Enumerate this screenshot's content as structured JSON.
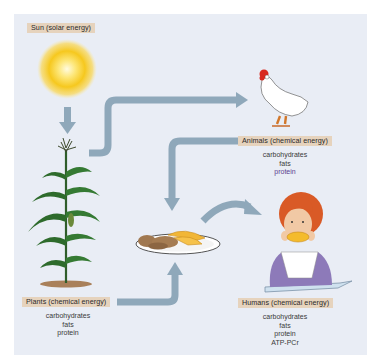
{
  "diagram": {
    "colors": {
      "panel_bg": "#e9edf5",
      "label_bg": "#e6d3bd",
      "arrow": "#8fa8ba",
      "sun_core": "#fff6c4",
      "sun_outer": "#f5c518",
      "plant_green": "#2f6b2c",
      "list_accent": "#5c3f8f"
    },
    "nodes": {
      "sun": {
        "label": "Sun (solar energy)",
        "icon": "sun-icon"
      },
      "plants": {
        "label": "Plants (chemical energy)",
        "icon": "corn-plant-icon",
        "items": [
          "carbohydrates",
          "fats",
          "protein"
        ]
      },
      "animals": {
        "label": "Animals (chemical energy)",
        "icon": "chicken-icon",
        "items": [
          "carbohydrates",
          "fats",
          "protein"
        ]
      },
      "food": {
        "icon": "plate-of-food-icon"
      },
      "humans": {
        "label": "Humans (chemical energy)",
        "icon": "child-eating-icon",
        "items": [
          "carbohydrates",
          "fats",
          "protein",
          "ATP-PCr"
        ]
      }
    },
    "edges": [
      {
        "from": "sun",
        "to": "plants"
      },
      {
        "from": "plants",
        "to": "animals"
      },
      {
        "from": "animals",
        "to": "food"
      },
      {
        "from": "plants",
        "to": "food"
      },
      {
        "from": "food",
        "to": "humans"
      }
    ]
  }
}
